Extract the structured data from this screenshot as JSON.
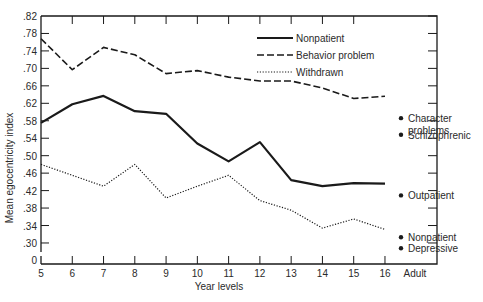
{
  "chart_data": {
    "type": "line",
    "title": "",
    "xlabel": "Year levels",
    "ylabel": "Mean egocentricity index",
    "x": [
      5,
      6,
      7,
      8,
      9,
      10,
      11,
      12,
      13,
      14,
      15,
      16
    ],
    "x_tick_labels": [
      "5",
      "6",
      "7",
      "8",
      "9",
      "10",
      "11",
      "12",
      "13",
      "14",
      "15",
      "16",
      "Adult"
    ],
    "y_tick_labels": [
      ".82",
      ".78",
      ".74",
      ".70",
      ".66",
      ".62",
      ".58",
      ".54",
      ".50",
      ".46",
      ".42",
      ".38",
      ".34",
      ".30",
      "0"
    ],
    "y_ticks": [
      0.82,
      0.78,
      0.74,
      0.7,
      0.66,
      0.62,
      0.58,
      0.54,
      0.5,
      0.46,
      0.42,
      0.38,
      0.34,
      0.3
    ],
    "ylim": [
      0.3,
      0.82
    ],
    "axis_break": "y-axis broken between 0 and .30",
    "grid": false,
    "legend_position": "top-right inside plot",
    "series": [
      {
        "name": "Nonpatient",
        "style": "solid",
        "values": [
          0.575,
          0.618,
          0.637,
          0.602,
          0.596,
          0.528,
          0.487,
          0.531,
          0.444,
          0.43,
          0.437,
          0.436
        ]
      },
      {
        "name": "Behavior problem",
        "style": "dashed",
        "values": [
          0.768,
          0.697,
          0.748,
          0.731,
          0.688,
          0.695,
          0.68,
          0.671,
          0.671,
          0.655,
          0.631,
          0.636
        ]
      },
      {
        "name": "Withdrawn",
        "style": "dotted",
        "values": [
          0.48,
          0.455,
          0.43,
          0.48,
          0.403,
          0.43,
          0.455,
          0.397,
          0.375,
          0.334,
          0.355,
          0.331
        ]
      }
    ],
    "adult_points": [
      {
        "label": "Character problems",
        "label_lines": [
          "Character",
          "problems"
        ],
        "value": 0.586
      },
      {
        "label": "Schizophrenic",
        "label_lines": [
          "Schizophrenic"
        ],
        "value": 0.548
      },
      {
        "label": "Outpatient",
        "label_lines": [
          "Outpatient"
        ],
        "value": 0.409
      },
      {
        "label": "Nonpatient",
        "label_lines": [
          "Nonpatient"
        ],
        "value": 0.313
      },
      {
        "label": "Depressive",
        "label_lines": [
          "Depressive"
        ],
        "value": 0.288
      }
    ]
  },
  "colors": {
    "ink": "#1a1a1a",
    "background": "#ffffff"
  }
}
